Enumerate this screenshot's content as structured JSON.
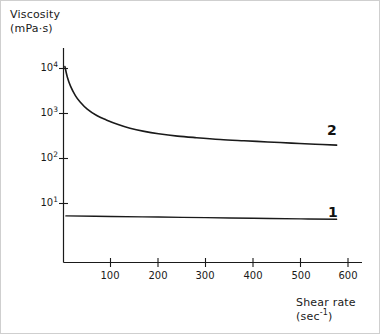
{
  "chart_data": {
    "type": "line",
    "title": "",
    "xlabel": "Shear rate",
    "xlabel_units": "(sec",
    "xlabel_exponent": "-1",
    "xlabel_units_close": ")",
    "ylabel": "Viscosity",
    "ylabel_units": "(mPa·s)",
    "yscale": "log",
    "xscale": "linear",
    "xlim": [
      0,
      630
    ],
    "ylim": [
      3,
      20000
    ],
    "grid": false,
    "legend": "inline-curve-labels",
    "xticks": [
      100,
      200,
      300,
      400,
      500,
      600
    ],
    "xtick_labels": [
      "100",
      "200",
      "300",
      "400",
      "500",
      "600"
    ],
    "yticks": [
      10,
      100,
      1000,
      10000
    ],
    "ytick_labels": [
      "10",
      "10",
      "10",
      "10"
    ],
    "ytick_exponents": [
      "1",
      "2",
      "3",
      "4"
    ],
    "ytick_label_1": "10",
    "ytick_exp_1": "1",
    "ytick_label_2": "10",
    "ytick_exp_2": "2",
    "ytick_label_3": "10",
    "ytick_exp_3": "3",
    "ytick_label_4": "10",
    "ytick_exp_4": "4",
    "series": [
      {
        "name": "2",
        "label": "2",
        "description": "Shear-thinning (pseudoplastic) sample: viscosity falls steeply from about 1.1e4 mPa·s near zero shear to a plateau near 2e2 mPa·s",
        "x": [
          3,
          8,
          15,
          25,
          35,
          50,
          70,
          90,
          115,
          140,
          170,
          200,
          240,
          280,
          330,
          380,
          430,
          480,
          530,
          575
        ],
        "y": [
          11000,
          6500,
          4000,
          2500,
          1800,
          1250,
          900,
          720,
          570,
          470,
          400,
          355,
          315,
          290,
          265,
          248,
          233,
          220,
          208,
          198
        ]
      },
      {
        "name": "1",
        "label": "1",
        "description": "Newtonian sample: viscosity essentially constant near 5 mPa·s over the whole shear-rate range",
        "x": [
          5,
          100,
          200,
          300,
          400,
          500,
          575
        ],
        "y": [
          5.3,
          5.15,
          5.0,
          4.85,
          4.7,
          4.55,
          4.45
        ]
      }
    ],
    "curve_label_1": "1",
    "curve_label_2": "2"
  },
  "figure": {
    "line_color": "#1a1a1a",
    "axis_color": "#1a1a1a",
    "frame_color": "#cfcfcf",
    "background": "#ffffff"
  }
}
